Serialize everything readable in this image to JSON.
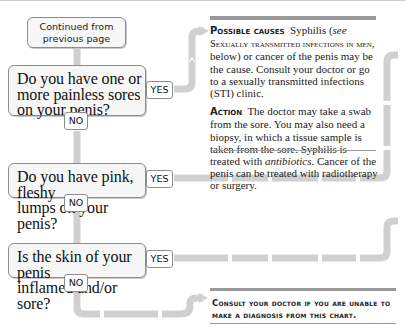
{
  "start": {
    "label": "Continued from previous page"
  },
  "questions": [
    {
      "text": "Do you have one or more painless sores on your penis?",
      "lines": [
        "Do you have one or",
        "more painless sores",
        "on your penis?"
      ],
      "yes_label": "YES",
      "no_label": "NO"
    },
    {
      "text": "Do you have pink, fleshy lumps on your penis?",
      "lines": [
        "Do you have pink, fleshy",
        "lumps on your penis?"
      ],
      "yes_label": "YES",
      "no_label": "NO"
    },
    {
      "text": "Is the skin of your penis inflamed and/or sore?",
      "lines": [
        "Is the skin of your penis",
        "inflamed and/or sore?"
      ],
      "yes_label": "YES",
      "no_label": "NO"
    }
  ],
  "answer": {
    "causes_heading": "Possible causes",
    "causes_text_1": "Syphilis (",
    "causes_see": "see",
    "causes_xref": "Sexually transmitted infections in men",
    "causes_text_2": ", below) or cancer of the penis may be the cause. Consult your doctor or go to a sexually transmitted infections (STI) clinic.",
    "action_heading": "Action",
    "action_text_1": "The doctor may take a swab from the sore. You may also need a biopsy, in which a tissue sample is taken from the sore. Syphilis is treated with ",
    "action_italic": "antibiotics",
    "action_text_2": ". Cancer of the penis can be treated with radiotherapy or surgery."
  },
  "final_note": "Consult your doctor if you are unable to make a diagnosis from this chart.",
  "colors": {
    "connector": "#d0d0d0",
    "box_border": "#8d8d8d",
    "box_fill": "#f7f7f7",
    "rule": "#9a9a9a",
    "text": "#222222"
  }
}
